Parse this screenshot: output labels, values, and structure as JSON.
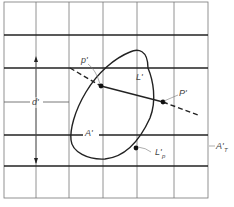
{
  "diagram": {
    "labels": {
      "p_prime": "p'",
      "L_prime": "L'",
      "P_prime": "P'",
      "d_prime": "d'",
      "A_prime": "A'",
      "L_p_prime": "L'",
      "L_p_sub": "p",
      "A_T_prime": "A'",
      "A_T_sub": "T"
    },
    "colors": {
      "line": "#222222",
      "grid_thin": "#777777",
      "label": "#444444",
      "background": "#ffffff"
    }
  }
}
